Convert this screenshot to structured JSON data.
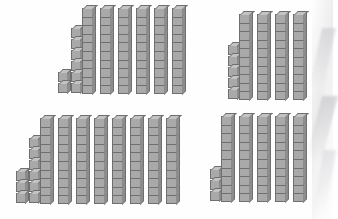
{
  "page": {
    "background_color": "#ffffff",
    "block_face_color": "#a9a9a9",
    "block_top_color": "#c3c3c3",
    "block_side_color": "#8d8d8d",
    "block_outline_color": "#6f6f6f",
    "units_per_rod": 10
  },
  "groups": [
    {
      "id": "group-top-left",
      "position": "top-left",
      "rods": 6,
      "units": 8,
      "unit_columns": [
        2,
        6
      ],
      "value": 68,
      "label": "68"
    },
    {
      "id": "group-top-right",
      "position": "top-right",
      "rods": 4,
      "units": 5,
      "unit_columns": [
        5
      ],
      "value": 45,
      "label": "45"
    },
    {
      "id": "group-bottom-left",
      "position": "bottom-left",
      "rods": 8,
      "units": 9,
      "unit_columns": [
        3,
        6
      ],
      "value": 89,
      "label": "89"
    },
    {
      "id": "group-bottom-right",
      "position": "bottom-right",
      "rods": 5,
      "units": 3,
      "unit_columns": [
        3
      ],
      "value": 53,
      "label": "53"
    }
  ],
  "artifacts": {
    "right_edge_smudges": 4
  }
}
